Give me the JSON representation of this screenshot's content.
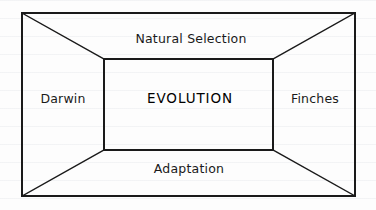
{
  "diagram": {
    "type": "one-point-perspective-box",
    "center_term": "EVOLUTION",
    "labels": {
      "top": "Natural Selection",
      "left": "Darwin",
      "right": "Finches",
      "bottom": "Adaptation"
    },
    "colors": {
      "stroke": "#1a1a1a",
      "background": "#fdfdfd",
      "text": "#1a1a1a"
    },
    "geometry": {
      "outer_rect": {
        "x": 22,
        "y": 13,
        "width": 333,
        "height": 183
      },
      "inner_rect": {
        "x": 104,
        "y": 59,
        "width": 169,
        "height": 91
      },
      "diagonals": [
        {
          "from": "outer-top-left",
          "to": "inner-top-left"
        },
        {
          "from": "outer-top-right",
          "to": "inner-top-right"
        },
        {
          "from": "outer-bottom-right",
          "to": "inner-bottom-right"
        },
        {
          "from": "outer-bottom-left",
          "to": "inner-bottom-left"
        }
      ]
    }
  }
}
